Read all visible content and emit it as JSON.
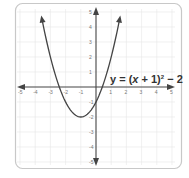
{
  "chart_data": {
    "type": "line",
    "title": "",
    "equation_label": "y = (x + 1)² − 2",
    "equation_parts": {
      "lhs": "y = (",
      "x": "x",
      "mid": " + 1)",
      "exp": "2",
      "rhs": " − 2"
    },
    "function": "(x+1)^2 - 2",
    "vertex": [
      -1,
      -2
    ],
    "xlabel": "",
    "ylabel": "",
    "xlim": [
      -5,
      5
    ],
    "ylim": [
      -5,
      5
    ],
    "grid": true,
    "x_ticks": [
      -5,
      -4,
      -3,
      -2,
      -1,
      1,
      2,
      3,
      4,
      5
    ],
    "y_ticks": [
      5,
      4,
      3,
      2,
      1,
      -1,
      -2,
      -3,
      -4,
      -5
    ],
    "series": [
      {
        "name": "y = (x + 1)^2 - 2",
        "x": [
          -3.6,
          -3,
          -2.5,
          -2,
          -1.5,
          -1,
          -0.5,
          0,
          0.5,
          1,
          1.6
        ],
        "y": [
          4.76,
          2,
          0.25,
          -1,
          -1.75,
          -2,
          -1.75,
          -1,
          0.25,
          2,
          4.76
        ]
      }
    ],
    "colors": {
      "curve": "#444444",
      "axes": "#444444",
      "grid": "#e3e3e3",
      "border": "#cccccc"
    }
  }
}
